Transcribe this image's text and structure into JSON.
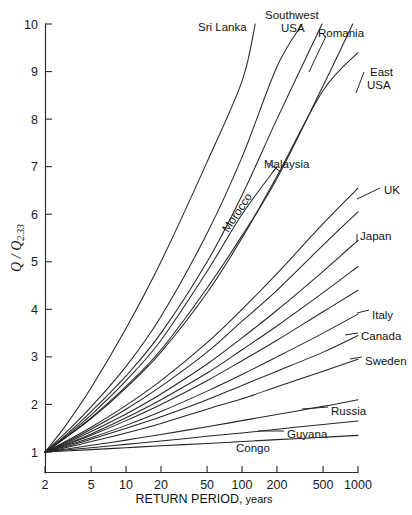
{
  "chart_data": {
    "type": "line",
    "title": "",
    "subtitle": "",
    "xlabel": "RETURN PERIOD, years",
    "xlabel_main": "RETURN PERIOD,",
    "xlabel_suffix": " years",
    "ylabel": "Q / Q2.33",
    "ylabel_numerator": "Q",
    "ylabel_divider": " / ",
    "ylabel_denominator": "Q",
    "ylabel_subscript": "2.33",
    "xscale": "log",
    "yscale": "linear",
    "xlim": [
      2,
      1000
    ],
    "ylim": [
      1,
      10
    ],
    "grid": false,
    "legend": "inline-labels",
    "xticks": [
      2,
      5,
      10,
      20,
      50,
      100,
      200,
      500,
      1000
    ],
    "xticklabels": [
      "2",
      "5",
      "10",
      "20",
      "50",
      "100",
      "200",
      "500",
      "1000"
    ],
    "yticks": [
      1,
      2,
      3,
      4,
      5,
      6,
      7,
      8,
      9,
      10
    ],
    "yticklabels": [
      "1",
      "2",
      "3",
      "4",
      "5",
      "6",
      "7",
      "8",
      "9",
      "10"
    ],
    "x": [
      2,
      3,
      5,
      10,
      20,
      50,
      100,
      200,
      500,
      1000
    ],
    "series": [
      {
        "name": "Sri Lanka",
        "label": "Sri Lanka",
        "label_lines": [
          "Sri Lanka"
        ],
        "values": [
          1.0,
          1.55,
          2.35,
          3.6,
          5.0,
          7.1,
          8.8,
          10.0,
          null,
          null
        ],
        "x_end": 130,
        "y_end": 10.0
      },
      {
        "name": "Southwest USA",
        "label": "Southwest USA",
        "label_lines": [
          "Southwest",
          "USA"
        ],
        "values": [
          1.0,
          1.4,
          1.95,
          2.8,
          3.85,
          5.6,
          7.2,
          9.1,
          10.0,
          null
        ],
        "x_end": 330,
        "y_end": 10.0
      },
      {
        "name": "Romania",
        "label": "Romania",
        "label_lines": [
          "Romania"
        ],
        "values": [
          1.0,
          1.35,
          1.85,
          2.6,
          3.5,
          5.0,
          6.4,
          8.0,
          10.0,
          null
        ],
        "x_end": 490,
        "y_end": 10.0
      },
      {
        "name": "East USA",
        "label": "East USA",
        "label_lines": [
          "East",
          "USA"
        ],
        "values": [
          1.0,
          1.3,
          1.7,
          2.35,
          3.1,
          4.35,
          5.5,
          6.8,
          8.6,
          9.4
        ],
        "x_end": 1000,
        "y_end": 9.4
      },
      {
        "name": "Malaysia",
        "label": "Malaysia",
        "label_lines": [
          "Malaysia"
        ],
        "values": [
          1.0,
          1.32,
          1.78,
          2.5,
          3.35,
          4.8,
          6.0,
          7.0,
          null,
          null
        ],
        "x_end": 200,
        "y_end": 7.0
      },
      {
        "name": "Morocco",
        "label": "Morocco",
        "label_lines": [
          "Morocco"
        ],
        "rotated": true,
        "values": [
          1.0,
          1.3,
          1.72,
          2.38,
          3.15,
          4.45,
          5.55,
          6.75,
          8.7,
          10.0
        ],
        "x_end": 900,
        "y_end": 10.0
      },
      {
        "name": "UK",
        "label": "UK",
        "label_lines": [
          "UK"
        ],
        "values": [
          1.0,
          1.22,
          1.52,
          1.98,
          2.5,
          3.3,
          4.0,
          4.75,
          5.8,
          6.55
        ],
        "x_end": 1000,
        "y_end": 6.55
      },
      {
        "name": "Japan",
        "label": "Japan",
        "label_lines": [
          "Japan"
        ],
        "values": [
          1.0,
          1.18,
          1.43,
          1.8,
          2.22,
          2.85,
          3.4,
          3.98,
          4.8,
          5.45
        ],
        "x_end": 1000,
        "y_end": 5.45
      },
      {
        "name": "Italy",
        "label": "Italy",
        "label_lines": [
          "Italy"
        ],
        "values": [
          1.0,
          1.13,
          1.3,
          1.56,
          1.85,
          2.28,
          2.63,
          3.0,
          3.5,
          3.9
        ],
        "x_end": 1000,
        "y_end": 3.9
      },
      {
        "name": "Canada",
        "label": "Canada",
        "label_lines": [
          "Canada"
        ],
        "values": [
          1.0,
          1.11,
          1.27,
          1.5,
          1.74,
          2.1,
          2.4,
          2.7,
          3.1,
          3.45
        ],
        "x_end": 1000,
        "y_end": 3.45
      },
      {
        "name": "Sweden",
        "label": "Sweden",
        "label_lines": [
          "Sweden"
        ],
        "values": [
          1.0,
          1.09,
          1.22,
          1.4,
          1.6,
          1.9,
          2.12,
          2.37,
          2.7,
          2.95
        ],
        "x_end": 1000,
        "y_end": 2.95
      },
      {
        "name": "Russia",
        "label": "Russia",
        "label_lines": [
          "Russia"
        ],
        "values": [
          1.0,
          1.06,
          1.14,
          1.25,
          1.37,
          1.53,
          1.66,
          1.79,
          1.96,
          2.1
        ],
        "x_end": 1000,
        "y_end": 2.1
      },
      {
        "name": "Guyana",
        "label": "Guyana",
        "label_lines": [
          "Guyana"
        ],
        "values": [
          1.0,
          1.04,
          1.09,
          1.16,
          1.23,
          1.33,
          1.4,
          1.48,
          1.58,
          1.65
        ],
        "x_end": 1000,
        "y_end": 1.65
      },
      {
        "name": "Congo",
        "label": "Congo",
        "label_lines": [
          "Congo"
        ],
        "values": [
          1.0,
          1.02,
          1.05,
          1.09,
          1.13,
          1.18,
          1.22,
          1.26,
          1.31,
          1.35
        ],
        "x_end": 1000,
        "y_end": 1.35
      },
      {
        "name": "Unlabeled A",
        "label": "",
        "label_lines": [],
        "values": [
          1.0,
          1.2,
          1.48,
          1.9,
          2.38,
          3.1,
          3.75,
          4.4,
          5.35,
          6.05
        ],
        "x_end": 1000,
        "y_end": 6.05
      },
      {
        "name": "Unlabeled B",
        "label": "",
        "label_lines": [],
        "values": [
          1.0,
          1.16,
          1.38,
          1.72,
          2.1,
          2.66,
          3.15,
          3.65,
          4.35,
          4.9
        ],
        "x_end": 1000,
        "y_end": 4.9
      },
      {
        "name": "Unlabeled C",
        "label": "",
        "label_lines": [],
        "values": [
          1.0,
          1.15,
          1.35,
          1.66,
          2.0,
          2.5,
          2.92,
          3.35,
          3.95,
          4.4
        ],
        "x_end": 1000,
        "y_end": 4.4
      }
    ],
    "annotations": [
      {
        "text": "Sri Lanka",
        "x_px": 198,
        "y_px": 22
      },
      {
        "text": "Southwest",
        "x_px": 265,
        "y_px": 10
      },
      {
        "text": "USA",
        "x_px": 281,
        "y_px": 23
      },
      {
        "text": "Romania",
        "x_px": 318,
        "y_px": 28
      },
      {
        "text": "East",
        "x_px": 370,
        "y_px": 67
      },
      {
        "text": "USA",
        "x_px": 367,
        "y_px": 80
      },
      {
        "text": "Malaysia",
        "x_px": 264,
        "y_px": 159
      },
      {
        "text": "Morocco",
        "x_px": 228,
        "y_px": 233
      },
      {
        "text": "UK",
        "x_px": 384,
        "y_px": 185
      },
      {
        "text": "Japan",
        "x_px": 360,
        "y_px": 231
      },
      {
        "text": "Italy",
        "x_px": 372,
        "y_px": 310
      },
      {
        "text": "Canada",
        "x_px": 361,
        "y_px": 331
      },
      {
        "text": "Sweden",
        "x_px": 365,
        "y_px": 356
      },
      {
        "text": "Russia",
        "x_px": 331,
        "y_px": 406
      },
      {
        "text": "Guyana",
        "x_px": 287,
        "y_px": 429
      },
      {
        "text": "Congo",
        "x_px": 236,
        "y_px": 443
      }
    ],
    "colors": {
      "background": "#ffffff",
      "axis": "#2b2b2b",
      "curve": "#262626",
      "text": "#1a1a1a"
    }
  }
}
